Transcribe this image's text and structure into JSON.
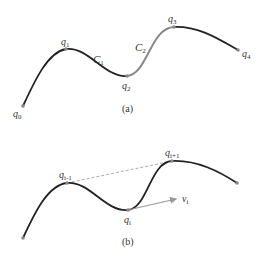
{
  "diagram_a": {
    "caption": "(a)",
    "points": [
      {
        "name": "q0",
        "label": "q",
        "sub": "0",
        "x": 23,
        "y": 106
      },
      {
        "name": "q1",
        "label": "q",
        "sub": "1",
        "x": 66,
        "y": 49
      },
      {
        "name": "q2",
        "label": "q",
        "sub": "2",
        "x": 127,
        "y": 76
      },
      {
        "name": "q3",
        "label": "q",
        "sub": "3",
        "x": 174,
        "y": 27
      },
      {
        "name": "q4",
        "label": "q",
        "sub": "4",
        "x": 238,
        "y": 50
      }
    ],
    "segment_labels": [
      {
        "label": "C",
        "sub": "1"
      },
      {
        "label": "C",
        "sub": "2"
      }
    ],
    "colors": {
      "curve": "#222222",
      "highlight_segment": "#888888",
      "point": "#888888"
    }
  },
  "diagram_b": {
    "caption": "(b)",
    "points": [
      {
        "name": "start",
        "x": 23,
        "y": 238
      },
      {
        "name": "q_i-1",
        "label": "q",
        "sub": "i-1",
        "x": 67,
        "y": 183
      },
      {
        "name": "q_i",
        "label": "q",
        "sub": "i",
        "x": 128,
        "y": 210
      },
      {
        "name": "q_i+1",
        "label": "q",
        "sub": "i+1",
        "x": 172,
        "y": 161
      },
      {
        "name": "end",
        "x": 237,
        "y": 183
      }
    ],
    "vector": {
      "label": "v",
      "sub": "i",
      "from": [
        128,
        210
      ],
      "to": [
        177,
        199
      ]
    },
    "colors": {
      "curve": "#222222",
      "dashed_line": "#aaaaaa",
      "vector": "#999999",
      "point": "#888888"
    }
  }
}
